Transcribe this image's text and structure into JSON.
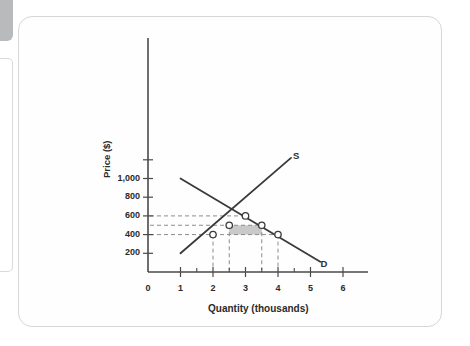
{
  "figure": {
    "background_color": "#ffffff",
    "frame_color": "#d5d6d7",
    "axis_color": "#4a4a4a",
    "curve_color": "#3a3a3a",
    "guide_color": "#8c8c8c",
    "shade_color": "#c9c9c9",
    "marker_fill": "#ffffff"
  },
  "chart_data": {
    "type": "line",
    "title": "",
    "subtitle": "",
    "xlabel": "Quantity (thousands)",
    "ylabel": "Price ($)",
    "xlim": [
      0,
      6.6
    ],
    "ylim": [
      0,
      1300
    ],
    "grid": false,
    "legend_position": "inline-curve-end",
    "x_ticks": [
      {
        "value": 0,
        "label": "0"
      },
      {
        "value": 1,
        "label": "1"
      },
      {
        "value": 2,
        "label": "2"
      },
      {
        "value": 3,
        "label": "3"
      },
      {
        "value": 4,
        "label": "4"
      },
      {
        "value": 5,
        "label": "5"
      },
      {
        "value": 6,
        "label": "6"
      }
    ],
    "x_minor_ticks": [
      1.5,
      2.5,
      3.5,
      4.5
    ],
    "y_ticks": [
      {
        "value": 200,
        "label": "200"
      },
      {
        "value": 400,
        "label": "400"
      },
      {
        "value": 600,
        "label": "600"
      },
      {
        "value": 800,
        "label": "800"
      },
      {
        "value": 1000,
        "label": "1,000"
      }
    ],
    "y_minor_ticks": [
      1200
    ],
    "series": [
      {
        "name": "S",
        "label": "S",
        "description": "Supply curve, upward sloping",
        "points": [
          [
            1,
            200
          ],
          [
            4.4,
            1220
          ]
        ]
      },
      {
        "name": "D",
        "label": "D",
        "description": "Demand curve, downward sloping",
        "points": [
          [
            1,
            1000
          ],
          [
            5.3,
            110
          ]
        ]
      }
    ],
    "markers": [
      {
        "name": "equilibrium",
        "x": 3,
        "y": 600,
        "on": "S,D"
      },
      {
        "name": "supply-at-500",
        "x": 2.5,
        "y": 500,
        "on": "S"
      },
      {
        "name": "demand-at-500",
        "x": 3.5,
        "y": 500,
        "on": "D"
      },
      {
        "name": "supply-at-400",
        "x": 2,
        "y": 400,
        "on": "S"
      },
      {
        "name": "demand-at-400",
        "x": 4,
        "y": 400,
        "on": "D"
      }
    ],
    "guide_lines_horizontal": [
      600,
      500,
      400
    ],
    "guide_lines_vertical": [
      2,
      2.5,
      3.5,
      4
    ],
    "shaded_region": {
      "name": "shaded-rectangle",
      "x_range": [
        2.5,
        3.5
      ],
      "y_range": [
        400,
        500
      ],
      "color": "#c9c9c9"
    },
    "annotations": [
      {
        "name": "supply-curve-label",
        "text": "S",
        "x": 4.55,
        "y": 1240
      },
      {
        "name": "demand-curve-label",
        "text": "D",
        "x": 5.4,
        "y": 90
      }
    ]
  }
}
